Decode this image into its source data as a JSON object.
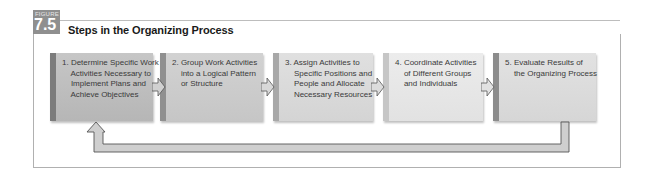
{
  "figure": {
    "label": "FIGURE",
    "number": "7.5",
    "title": "Steps in the Organizing Process"
  },
  "steps": [
    {
      "number": "1.",
      "text": "1. Determine Specific Work\n    Activities Necessary to\n    Implement Plans and\n    Achieve Objectives",
      "fill": "#bdbdbd",
      "bevel": "#7c7c7c"
    },
    {
      "number": "2.",
      "text": "2. Group Work Activities\n    into a Logical Pattern\n    or Structure",
      "fill": "#cbcbcb",
      "bevel": "#909090"
    },
    {
      "number": "3.",
      "text": "3. Assign Activities to\n    Specific Positions and\n    People and Allocate\n    Necessary Resources",
      "fill": "#dadada",
      "bevel": "#a6a6a6"
    },
    {
      "number": "4.",
      "text": "4. Coordinate Activities\n    of Different Groups\n    and Individuals",
      "fill": "#e6e6e6",
      "bevel": "#c4c4c4"
    },
    {
      "number": "5.",
      "text": "5. Evaluate Results of\n    the Organizing Process",
      "fill": "#dcdcdc",
      "bevel": "#8c8c8c"
    }
  ],
  "connectors": {
    "forward_arrows": 4,
    "feedback_loop": "from step 5 back to step 1"
  },
  "colors": {
    "badge": "#8f8f8f",
    "arrow_fill": "#d0d0d0",
    "arrow_stroke": "#555555",
    "frame": "#b0b0b0"
  }
}
